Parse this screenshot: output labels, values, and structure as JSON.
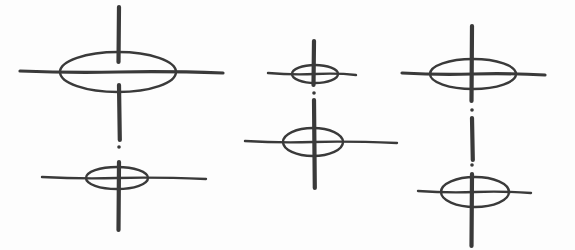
{
  "diagram": {
    "ink_color": "#3a3a3a",
    "background": "#fdfdfd",
    "figures": [
      {
        "id": "left",
        "axis_x": 119,
        "vertical_segments": [
          [
            7,
            62
          ],
          [
            85,
            140
          ],
          [
            162,
            230
          ]
        ],
        "dots": [
          147
        ],
        "crosses": [
          {
            "cx": 118,
            "cy": 72,
            "rx": 58,
            "ry": 20,
            "line_x1": 20,
            "line_x2": 223
          },
          {
            "cx": 117,
            "cy": 178,
            "rx": 31,
            "ry": 11,
            "line_x1": 42,
            "line_x2": 206
          }
        ]
      },
      {
        "id": "middle",
        "axis_x": 314,
        "vertical_segments": [
          [
            41,
            85
          ],
          [
            100,
            188
          ]
        ],
        "dots": [
          93
        ],
        "crosses": [
          {
            "cx": 315,
            "cy": 74,
            "rx": 23,
            "ry": 9,
            "line_x1": 268,
            "line_x2": 356
          },
          {
            "cx": 313,
            "cy": 142,
            "rx": 30,
            "ry": 14,
            "line_x1": 245,
            "line_x2": 397
          }
        ]
      },
      {
        "id": "right",
        "axis_x": 472,
        "vertical_segments": [
          [
            26,
            101
          ],
          [
            118,
            160
          ],
          [
            174,
            246
          ]
        ],
        "dots": [
          110,
          165
        ],
        "crosses": [
          {
            "cx": 473,
            "cy": 74,
            "rx": 43,
            "ry": 15,
            "line_x1": 402,
            "line_x2": 545
          },
          {
            "cx": 475,
            "cy": 192,
            "rx": 34,
            "ry": 15,
            "line_x1": 418,
            "line_x2": 531
          }
        ]
      }
    ]
  }
}
